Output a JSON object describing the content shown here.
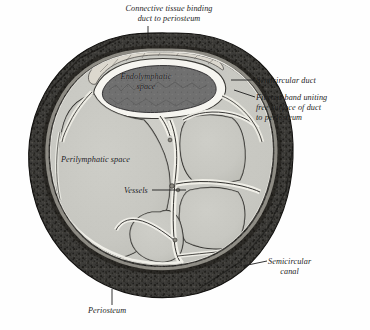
{
  "figure": {
    "type": "anatomical-illustration",
    "background_color": "#fefefe",
    "ink_color": "#1d1d1d"
  },
  "labels": {
    "connective_tissue": "Connective tissue binding\nduct to periosteum",
    "semicircular_duct": "Semicircular duct",
    "fibrous_band": "Fibrous band uniting\nfree surface of duct\nto periosteum",
    "semicircular_canal": "Semicircular\ncanal",
    "periosteum": "Periosteum",
    "endolymphatic_space": "Endolymphatic\nspace",
    "perilymphatic_space": "Perilymphatic space",
    "vessels": "Vessels"
  },
  "structures": {
    "bone_ring": {
      "name": "semicircular canal bone",
      "fill": "#3a3936",
      "texture": "speckled-cancellous"
    },
    "periosteum_layer": {
      "name": "periosteum",
      "fill": "#5a5854"
    },
    "perilymphatic_space": {
      "name": "perilymphatic space",
      "fill": "#c9c9c4"
    },
    "endolymphatic_space": {
      "name": "endolymphatic space",
      "fill": "#6f6f6c"
    },
    "duct_wall": {
      "name": "semicircular duct wall",
      "fill": "#f4f4f0"
    },
    "fibrous_septa": {
      "name": "fibrous trabeculae and vessels",
      "fill": "#ebebe5",
      "stroke": "#2e2e2c"
    }
  },
  "leader_lines": [
    {
      "name": "connective-tissue-leader",
      "from": [
        148,
        26
      ],
      "to": [
        148,
        38
      ]
    },
    {
      "name": "semicircular-duct-leader",
      "from": [
        232,
        80
      ],
      "to": [
        256,
        80
      ]
    },
    {
      "name": "fibrous-band-leader",
      "from": [
        234,
        92
      ],
      "to": [
        256,
        97
      ]
    },
    {
      "name": "semicircular-canal-leader",
      "from": [
        243,
        266
      ],
      "to": [
        266,
        261
      ]
    },
    {
      "name": "periosteum-leader",
      "from": [
        112,
        290
      ],
      "to": [
        112,
        305
      ]
    },
    {
      "name": "vessels-leader",
      "from": [
        151,
        190
      ],
      "to": [
        186,
        190
      ]
    }
  ]
}
